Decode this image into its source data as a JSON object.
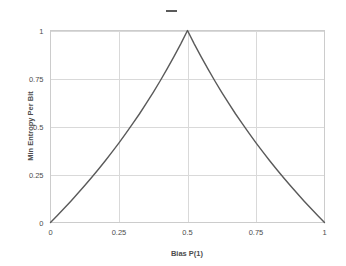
{
  "legend": {
    "swatch_name": "series-line-swatch",
    "label": ""
  },
  "chart_data": {
    "type": "line",
    "title": "",
    "xlabel": "Bias P(1)",
    "ylabel": "Min Entropy Per Bit",
    "xlim": [
      0,
      1
    ],
    "ylim": [
      0,
      1
    ],
    "grid": true,
    "legend_position": "top-center",
    "line_color": "#5a5a5a",
    "grid_color": "#d9d9d9",
    "frame_color": "#cccccc",
    "xticks": [
      0,
      0.25,
      0.5,
      0.75,
      1
    ],
    "xticklabels": [
      "0",
      "0.25",
      "0.5",
      "0.75",
      "1"
    ],
    "yticks": [
      0,
      0.25,
      0.5,
      0.75,
      1
    ],
    "yticklabels": [
      "0",
      "0.25",
      "0.5",
      "0.75",
      "1"
    ],
    "series": [
      {
        "name": "Min Entropy Per Bit",
        "x": [
          0,
          0.025,
          0.05,
          0.075,
          0.1,
          0.125,
          0.15,
          0.175,
          0.2,
          0.225,
          0.25,
          0.275,
          0.3,
          0.325,
          0.35,
          0.375,
          0.4,
          0.425,
          0.45,
          0.475,
          0.5,
          0.525,
          0.55,
          0.575,
          0.6,
          0.625,
          0.65,
          0.675,
          0.7,
          0.725,
          0.75,
          0.775,
          0.8,
          0.825,
          0.85,
          0.875,
          0.9,
          0.925,
          0.95,
          0.975,
          1
        ],
        "values": [
          0,
          0.0366,
          0.074,
          0.1124,
          0.152,
          0.1926,
          0.2345,
          0.2776,
          0.3219,
          0.3677,
          0.415,
          0.4638,
          0.5146,
          0.5664,
          0.6215,
          0.6781,
          0.737,
          0.7985,
          0.8625,
          0.9294,
          1,
          0.9294,
          0.8625,
          0.7985,
          0.737,
          0.6781,
          0.6215,
          0.5664,
          0.5146,
          0.4638,
          0.415,
          0.3677,
          0.3219,
          0.2776,
          0.2345,
          0.1926,
          0.152,
          0.1124,
          0.074,
          0.0366,
          0
        ]
      }
    ]
  }
}
